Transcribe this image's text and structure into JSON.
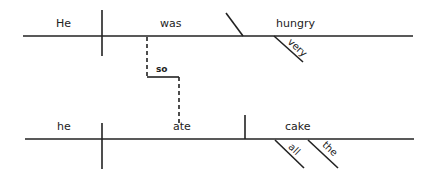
{
  "diagram": {
    "type": "sentence-diagram",
    "clause1": {
      "subject": "He",
      "verb": "was",
      "complement": "hungry",
      "modifier": "very"
    },
    "connector": "so",
    "clause2": {
      "subject": "he",
      "verb": "ate",
      "object": "cake",
      "modifiers": [
        "all",
        "the"
      ]
    },
    "line_color": "#222222"
  }
}
